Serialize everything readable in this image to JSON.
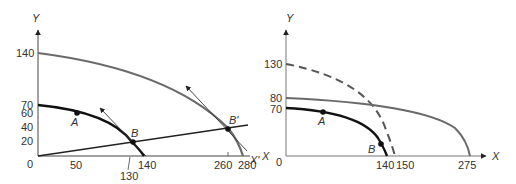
{
  "left_panel": {
    "axis_y_label": "Y",
    "axis_x_label": "X'",
    "origin_label": "0",
    "y_ticks": [
      "140",
      "70",
      "60",
      "40",
      "20"
    ],
    "x_ticks": [
      "50",
      "130",
      "140",
      "260",
      "280"
    ],
    "points": {
      "A": "A",
      "B": "B",
      "B_prime": "B'"
    },
    "curves": [
      {
        "name": "inner PPF",
        "y_intercept": 70,
        "x_intercept": 140,
        "color": "#111111"
      },
      {
        "name": "outer PPF",
        "y_intercept": 140,
        "x_intercept": 280,
        "color": "#666666"
      },
      {
        "name": "ray from origin",
        "through": [
          "B (130,20)",
          "B' (260,40)"
        ]
      }
    ]
  },
  "right_panel": {
    "axis_y_label": "Y",
    "axis_x_label_right": "X",
    "axis_x_label_left": "X",
    "origin_label": "0",
    "y_ticks": [
      "130",
      "80",
      "70"
    ],
    "x_ticks": [
      "140",
      "150",
      "275"
    ],
    "points": {
      "A": "A",
      "B": "B"
    },
    "curves": [
      {
        "name": "original PPF",
        "y_intercept": 70,
        "x_intercept": 140,
        "color": "#111111"
      },
      {
        "name": "dashed PPF",
        "y_intercept": 130,
        "x_intercept": 150,
        "style": "dashed"
      },
      {
        "name": "gray PPF",
        "y_intercept": 80,
        "x_intercept": 275,
        "color": "#666666"
      }
    ]
  }
}
